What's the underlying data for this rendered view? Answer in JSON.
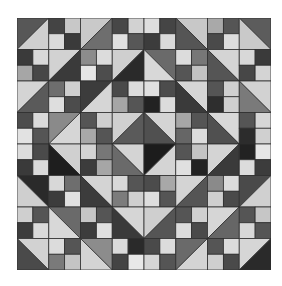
{
  "image": {
    "subject": "quilt-block-pattern",
    "grid_units": 8,
    "unit_types": {
      "hst": "half-square triangle",
      "fp": "four-patch"
    }
  },
  "quilt": {
    "rows": [
      [
        {
          "t": "hst",
          "d": "/",
          "a": "#575757",
          "b": "#cfcfcf"
        },
        {
          "t": "fp",
          "c": [
            "#444444",
            "#c8c8c8",
            "#dadada",
            "#3a3a3a"
          ]
        },
        {
          "t": "hst",
          "d": "/",
          "a": "#c9c9c9",
          "b": "#6e6e6e"
        },
        {
          "t": "fp",
          "c": [
            "#474747",
            "#d2d2d2",
            "#e0e0e0",
            "#575757"
          ]
        },
        {
          "t": "fp",
          "c": [
            "#dedede",
            "#454545",
            "#3c3c3c",
            "#dadada"
          ]
        },
        {
          "t": "hst",
          "d": "\\",
          "a": "#c8c8c8",
          "b": "#555555"
        },
        {
          "t": "fp",
          "c": [
            "#a9a9a9",
            "#555555",
            "#4a4a4a",
            "#dcdcdc"
          ]
        },
        {
          "t": "hst",
          "d": "\\",
          "a": "#5c5c5c",
          "b": "#c9c9c9"
        }
      ],
      [
        {
          "t": "fp",
          "c": [
            "#3a3a3a",
            "#d8d8d8",
            "#a6a6a6",
            "#474747"
          ]
        },
        {
          "t": "hst",
          "d": "/",
          "a": "#d2d2d2",
          "b": "#3a3a3a"
        },
        {
          "t": "fp",
          "c": [
            "#8c8c8c",
            "#dcdcdc",
            "#e6e6e6",
            "#4d4d4d"
          ]
        },
        {
          "t": "hst",
          "d": "/",
          "a": "#cfcfcf",
          "b": "#2a2a2a"
        },
        {
          "t": "hst",
          "d": "\\",
          "a": "#6a6a6a",
          "b": "#d8d8d8"
        },
        {
          "t": "fp",
          "c": [
            "#dcdcdc",
            "#777777",
            "#555555",
            "#c2c2c2"
          ]
        },
        {
          "t": "hst",
          "d": "\\",
          "a": "#d4d4d4",
          "b": "#555555"
        },
        {
          "t": "fp",
          "c": [
            "#d8d8d8",
            "#3a3a3a",
            "#474747",
            "#d4d4d4"
          ]
        }
      ],
      [
        {
          "t": "hst",
          "d": "/",
          "a": "#d4d4d4",
          "b": "#5a5a5a"
        },
        {
          "t": "fp",
          "c": [
            "#6e6e6e",
            "#cfcfcf",
            "#dedede",
            "#4c4c4c"
          ]
        },
        {
          "t": "hst",
          "d": "/",
          "a": "#3c3c3c",
          "b": "#d6d6d6"
        },
        {
          "t": "fp",
          "c": [
            "#4a4a4a",
            "#dcdcdc",
            "#a6a6a6",
            "#555555"
          ]
        },
        {
          "t": "fp",
          "c": [
            "#e0e0e0",
            "#4c4c4c",
            "#222222",
            "#dcdcdc"
          ]
        },
        {
          "t": "hst",
          "d": "\\",
          "a": "#d6d6d6",
          "b": "#3a3a3a"
        },
        {
          "t": "fp",
          "c": [
            "#555555",
            "#d0d0d0",
            "#2e2e2e",
            "#cfcfcf"
          ]
        },
        {
          "t": "hst",
          "d": "\\",
          "a": "#d2d2d2",
          "b": "#7a7a7a"
        }
      ],
      [
        {
          "t": "fp",
          "c": [
            "#4c4c4c",
            "#dadada",
            "#e2e2e2",
            "#555555"
          ]
        },
        {
          "t": "hst",
          "d": "/",
          "a": "#8a8a8a",
          "b": "#d6d6d6"
        },
        {
          "t": "fp",
          "c": [
            "#555555",
            "#cfcfcf",
            "#a8a8a8",
            "#555555"
          ]
        },
        {
          "t": "hst",
          "d": "/",
          "a": "#d0d0d0",
          "b": "#5a5a5a"
        },
        {
          "t": "hst",
          "d": "\\",
          "a": "#d4d4d4",
          "b": "#505050"
        },
        {
          "t": "fp",
          "c": [
            "#a6a6a6",
            "#555555",
            "#666666",
            "#dcdcdc"
          ]
        },
        {
          "t": "hst",
          "d": "\\",
          "a": "#d8d8d8",
          "b": "#505050"
        },
        {
          "t": "fp",
          "c": [
            "#555555",
            "#d6d6d6",
            "#2c2c2c",
            "#d0d0d0"
          ]
        }
      ],
      [
        {
          "t": "fp",
          "c": [
            "#dcdcdc",
            "#4a4a4a",
            "#3a3a3a",
            "#dadada"
          ]
        },
        {
          "t": "hst",
          "d": "\\",
          "a": "#d0d0d0",
          "b": "#1e1e1e"
        },
        {
          "t": "fp",
          "c": [
            "#d4d4d4",
            "#777777",
            "#3c3c3c",
            "#a6a6a6"
          ]
        },
        {
          "t": "hst",
          "d": "\\",
          "a": "#d4d4d4",
          "b": "#6a6a6a"
        },
        {
          "t": "hst",
          "d": "/",
          "a": "#1c1c1c",
          "b": "#d4d4d4"
        },
        {
          "t": "fp",
          "c": [
            "#555555",
            "#c4c4c4",
            "#e0e0e0",
            "#222222"
          ]
        },
        {
          "t": "hst",
          "d": "/",
          "a": "#d4d4d4",
          "b": "#3a3a3a"
        },
        {
          "t": "fp",
          "c": [
            "#222222",
            "#e6e6e6",
            "#dcdcdc",
            "#3c3c3c"
          ]
        }
      ],
      [
        {
          "t": "hst",
          "d": "\\",
          "a": "#2a2a2a",
          "b": "#cfcfcf"
        },
        {
          "t": "fp",
          "c": [
            "#d8d8d8",
            "#6e6e6e",
            "#3c3c3c",
            "#e0e0e0"
          ]
        },
        {
          "t": "hst",
          "d": "\\",
          "a": "#d4d4d4",
          "b": "#3c3c3c"
        },
        {
          "t": "fp",
          "c": [
            "#d8d8d8",
            "#555555",
            "#7c7c7c",
            "#cfcfcf"
          ]
        },
        {
          "t": "fp",
          "c": [
            "#4c4c4c",
            "#a8a8a8",
            "#dedede",
            "#555555"
          ]
        },
        {
          "t": "hst",
          "d": "/",
          "a": "#d4d4d4",
          "b": "#555555"
        },
        {
          "t": "fp",
          "c": [
            "#8a8a8a",
            "#dcdcdc",
            "#cfcfcf",
            "#4a4a4a"
          ]
        },
        {
          "t": "hst",
          "d": "/",
          "a": "#4a4a4a",
          "b": "#d0d0d0"
        }
      ],
      [
        {
          "t": "fp",
          "c": [
            "#cfcfcf",
            "#555555",
            "#3c3c3c",
            "#dadada"
          ]
        },
        {
          "t": "hst",
          "d": "\\",
          "a": "#6a6a6a",
          "b": "#d8d8d8"
        },
        {
          "t": "fp",
          "c": [
            "#c6c6c6",
            "#555555",
            "#3c3c3c",
            "#e0e0e0"
          ]
        },
        {
          "t": "hst",
          "d": "\\",
          "a": "#d6d6d6",
          "b": "#3a3a3a"
        },
        {
          "t": "hst",
          "d": "/",
          "a": "#cfcfcf",
          "b": "#555555"
        },
        {
          "t": "fp",
          "c": [
            "#555555",
            "#d0d0d0",
            "#dcdcdc",
            "#4a4a4a"
          ]
        },
        {
          "t": "hst",
          "d": "/",
          "a": "#d6d6d6",
          "b": "#666666"
        },
        {
          "t": "fp",
          "c": [
            "#555555",
            "#c6c6c6",
            "#d8d8d8",
            "#555555"
          ]
        }
      ],
      [
        {
          "t": "hst",
          "d": "\\",
          "a": "#d2d2d2",
          "b": "#4a4a4a"
        },
        {
          "t": "fp",
          "c": [
            "#dcdcdc",
            "#555555",
            "#7a7a7a",
            "#c4c4c4"
          ]
        },
        {
          "t": "hst",
          "d": "\\",
          "a": "#8c8c8c",
          "b": "#d4d4d4"
        },
        {
          "t": "fp",
          "c": [
            "#dadada",
            "#2a2a2a",
            "#444444",
            "#e8e8e8"
          ]
        },
        {
          "t": "fp",
          "c": [
            "#4a4a4a",
            "#dcdcdc",
            "#d6d6d6",
            "#555555"
          ]
        },
        {
          "t": "hst",
          "d": "/",
          "a": "#6a6a6a",
          "b": "#d4d4d4"
        },
        {
          "t": "fp",
          "c": [
            "#555555",
            "#dcdcdc",
            "#cfcfcf",
            "#4a4a4a"
          ]
        },
        {
          "t": "hst",
          "d": "/",
          "a": "#d6d6d6",
          "b": "#2a2a2a"
        }
      ]
    ],
    "seam_color": "#2e2e2e",
    "background": "#ffffff"
  }
}
